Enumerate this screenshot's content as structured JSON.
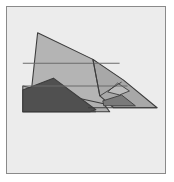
{
  "figure": {
    "view": "side profile",
    "caption": "",
    "frame": {
      "border_color": "#8a8a8a",
      "background_color": "#ececec",
      "outer_background_color": "#ffffff",
      "border_width_px": 1,
      "x": 6,
      "y": 6,
      "width": 160,
      "height": 168
    },
    "palette": {
      "light_gray": "#c0c0c0",
      "mid_gray": "#a8a8a8",
      "wing_gray": "#b0b0b0",
      "dark_gray": "#505050",
      "shadow_gray": "#6e6e6e",
      "outline": "#3c3c3c",
      "fold_line": "#6b6b6b"
    },
    "shapes": [
      {
        "name": "upper-wing-panel",
        "fill": "#b4b4b4",
        "points": "31,88 37,32 93,59 122,82 104,104 78,104"
      },
      {
        "name": "rear-fuselage-wing",
        "fill": "#a8a8a8",
        "points": "93,59 124,80 158,108 114,108 100,96"
      },
      {
        "name": "lower-body-panel",
        "fill": "#b0b0b0",
        "points": "22,86 31,88 104,104 110,112 96,112 22,112"
      },
      {
        "name": "dark-underwing",
        "fill": "#505050",
        "points": "22,112 22,90 53,78 96,110 90,112"
      },
      {
        "name": "tail-shadow-wedge",
        "fill": "#7a7a7a",
        "points": "103,101 122,95 136,106 104,106"
      },
      {
        "name": "nose-highlight",
        "fill": "#bdbdbd",
        "points": "118,83 130,91 120,95 108,92"
      }
    ],
    "fold_lines": [
      {
        "name": "upper-fold-line",
        "x1": 22,
        "y1": 63,
        "x2": 120,
        "y2": 63
      },
      {
        "name": "mid-fold-line",
        "x1": 22,
        "y1": 86,
        "x2": 128,
        "y2": 86
      },
      {
        "name": "base-line",
        "x1": 88,
        "y1": 108,
        "x2": 158,
        "y2": 108
      },
      {
        "name": "bottom-edge-line",
        "x1": 22,
        "y1": 112,
        "x2": 96,
        "y2": 112
      }
    ],
    "labels": {
      "alt_text": "Grayscale line drawing of a folded paper dart airplane seen from the side, with a large swept wing, a dark shaded underwing, and a long pointed tail extending to the right."
    }
  }
}
